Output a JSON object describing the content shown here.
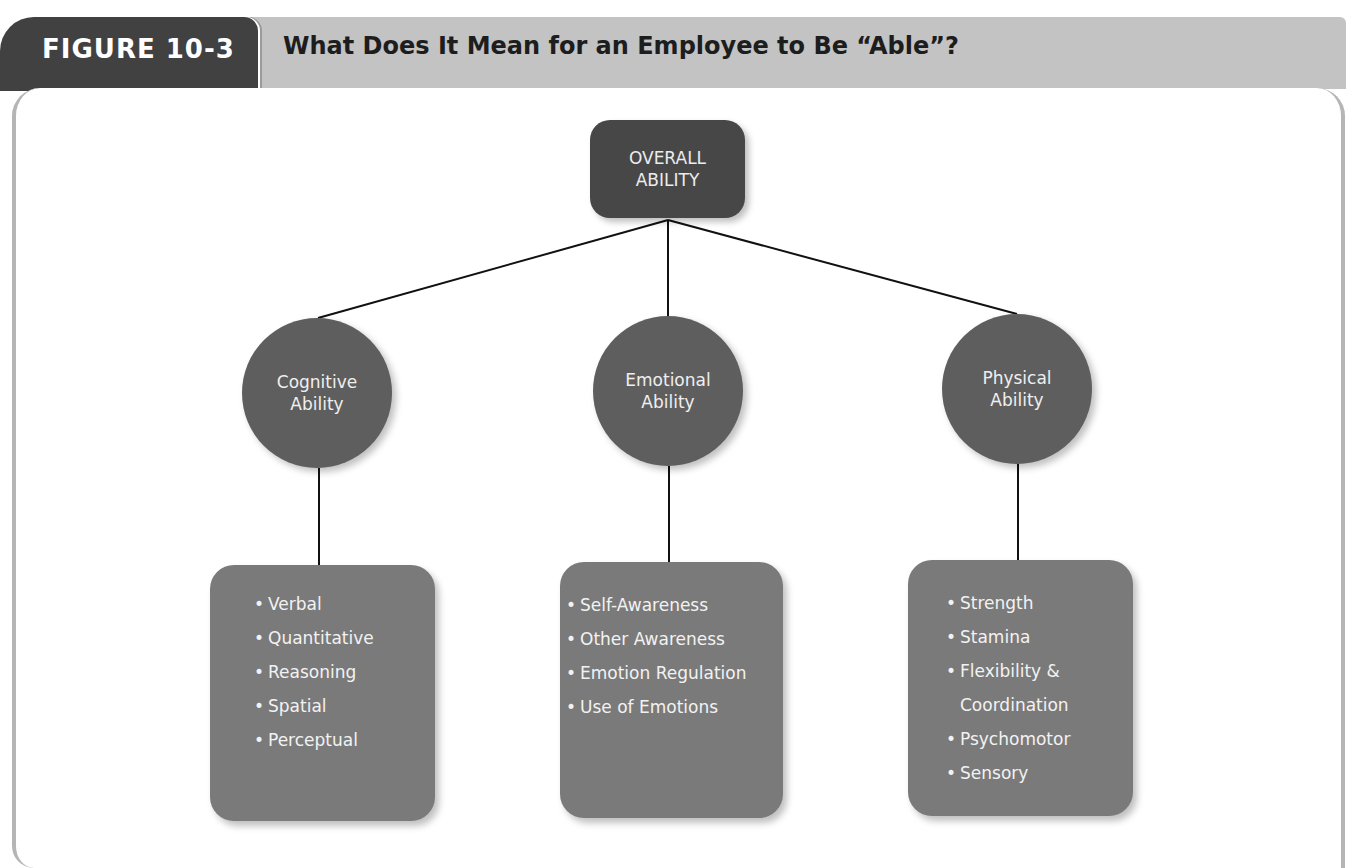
{
  "header": {
    "figure_label": "FIGURE 10-3",
    "title": "What Does It Mean for an Employee to Be “Able”?"
  },
  "diagram": {
    "root": {
      "line1": "OVERALL",
      "line2": "ABILITY"
    },
    "branches": [
      {
        "name": "Cognitive Ability",
        "line1": "Cognitive",
        "line2": "Ability",
        "items": [
          "Verbal",
          "Quantitative",
          "Reasoning",
          "Spatial",
          "Perceptual"
        ]
      },
      {
        "name": "Emotional Ability",
        "line1": "Emotional",
        "line2": "Ability",
        "items": [
          "Self-Awareness",
          "Other Awareness",
          "Emotion Regulation",
          "Use of Emotions"
        ]
      },
      {
        "name": "Physical Ability",
        "line1": "Physical",
        "line2": "Ability",
        "items": [
          "Strength",
          "Stamina",
          "Flexibility &",
          "Coordination",
          "Psychomotor",
          "Sensory"
        ]
      }
    ],
    "bullet": "•"
  },
  "colors": {
    "tab": "#414141",
    "header_bar": "#c3c3c3",
    "root_box": "#474747",
    "circle": "#5e5e5e",
    "list_box": "#7a7a7a",
    "connector": "#111111"
  }
}
